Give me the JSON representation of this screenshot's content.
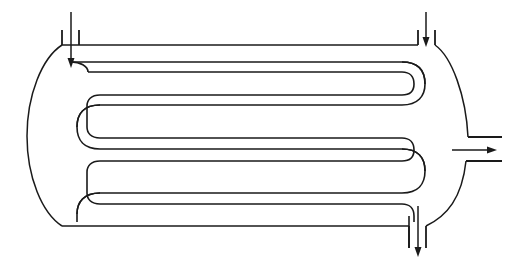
{
  "diagram": {
    "type": "engineering-line-drawing",
    "background_color": "#ffffff",
    "line_color": "#1a1a1a",
    "canvas": {
      "width": 511,
      "height": 270
    }
  },
  "shell": {
    "name": "pressure-vessel-shell",
    "top_y": 45,
    "bottom_y": 226,
    "left_tangent_x": 62,
    "right_tangent_x": 437,
    "left_head_apex_x": 27,
    "right_head_apex_x": 470,
    "stroke_width": 1.5
  },
  "coil": {
    "name": "serpentine-tube-bundle",
    "passes": 4,
    "left_returns": 3,
    "right_returns": 2,
    "tube_wall_gap": 10,
    "stroke_width": 1.6,
    "pass_center_y": [
      67,
      100,
      133,
      166,
      199
    ],
    "left_bend_x": 88,
    "right_bend_x": 418
  },
  "nozzles": [
    {
      "id": "inlet-top-left",
      "label": "tube-side inlet",
      "position": "top-left",
      "orientation": "vertical-down",
      "stub_left_x": 62,
      "stub_right_x": 79,
      "stub_top_y": 30,
      "arrow_x": 71,
      "arrow_from_y": 12,
      "arrow_to_y": 66,
      "flow_direction": "down"
    },
    {
      "id": "inlet-top-right",
      "label": "shell-side inlet",
      "position": "top-right",
      "orientation": "vertical-down",
      "stub_left_x": 418,
      "stub_right_x": 435,
      "stub_top_y": 30,
      "arrow_x": 426,
      "arrow_from_y": 12,
      "arrow_to_y": 46,
      "flow_direction": "down"
    },
    {
      "id": "outlet-right-side",
      "label": "shell-side outlet",
      "position": "right-middle",
      "orientation": "horizontal-right",
      "stub_top_y": 138,
      "stub_bottom_y": 160,
      "stub_right_x": 502,
      "arrow_y": 150,
      "arrow_from_x": 452,
      "arrow_to_x": 497,
      "flow_direction": "right"
    },
    {
      "id": "outlet-bottom",
      "label": "tube-side outlet",
      "position": "bottom-right",
      "orientation": "vertical-down",
      "stub_left_x": 409,
      "stub_right_x": 426,
      "stub_bottom_y": 258,
      "arrow_x": 418,
      "arrow_from_y": 206,
      "arrow_to_y": 256,
      "flow_direction": "down"
    }
  ],
  "arrows": {
    "head_length": 9,
    "head_width": 6
  }
}
